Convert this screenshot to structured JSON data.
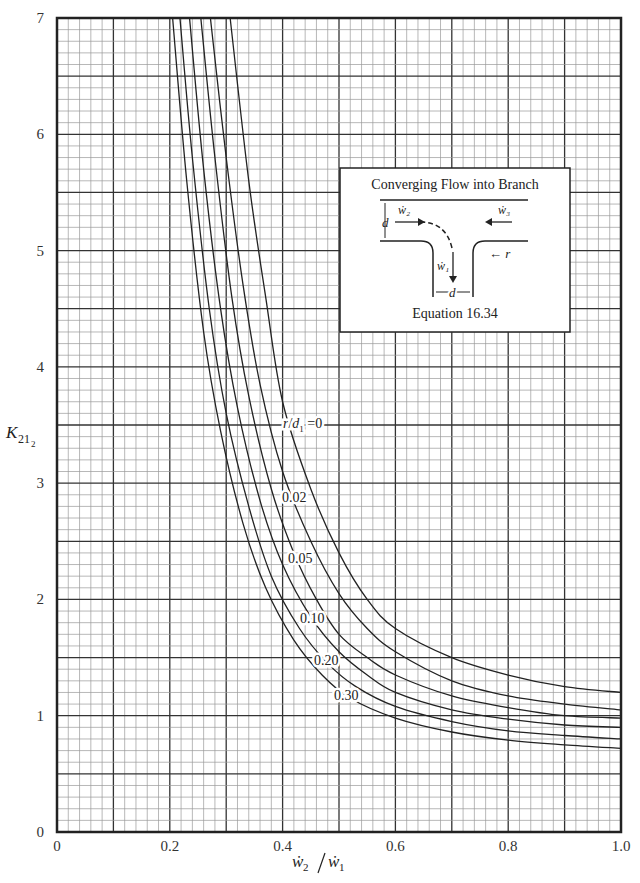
{
  "chart_data": {
    "type": "line",
    "title": "",
    "xlabel": "ẇ2/ẇ1",
    "ylabel": "K21_2",
    "xlim": [
      0,
      1.0
    ],
    "ylim": [
      0,
      7
    ],
    "grid": true,
    "x_ticks": [
      "0",
      "0.2",
      "0.4",
      "0.6",
      "0.8",
      "1.0"
    ],
    "y_ticks": [
      "0",
      "1",
      "2",
      "3",
      "4",
      "5",
      "6",
      "7"
    ],
    "legend_position": "inline labels",
    "series": [
      {
        "name": "r/d1=0",
        "label": "r/d1=0",
        "x": [
          0.307,
          0.34,
          0.37,
          0.4,
          0.45,
          0.5,
          0.55,
          0.6,
          0.7,
          0.8,
          0.9,
          1.0
        ],
        "y": [
          7.0,
          5.6,
          4.6,
          3.7,
          2.95,
          2.4,
          2.0,
          1.75,
          1.5,
          1.35,
          1.25,
          1.2
        ]
      },
      {
        "name": "r/d1=0.02",
        "label": "0.02",
        "x": [
          0.272,
          0.3,
          0.33,
          0.36,
          0.4,
          0.45,
          0.5,
          0.55,
          0.6,
          0.7,
          0.8,
          0.9,
          1.0
        ],
        "y": [
          7.0,
          5.8,
          4.7,
          3.85,
          3.1,
          2.5,
          2.05,
          1.75,
          1.55,
          1.3,
          1.17,
          1.1,
          1.05
        ]
      },
      {
        "name": "r/d1=0.05",
        "label": "0.05",
        "x": [
          0.255,
          0.28,
          0.31,
          0.34,
          0.38,
          0.42,
          0.46,
          0.5,
          0.55,
          0.6,
          0.7,
          0.8,
          0.9,
          1.0
        ],
        "y": [
          7.0,
          5.8,
          4.6,
          3.75,
          2.95,
          2.4,
          2.0,
          1.7,
          1.5,
          1.35,
          1.17,
          1.07,
          1.0,
          0.98
        ]
      },
      {
        "name": "r/d1=0.10",
        "label": "0.10",
        "x": [
          0.235,
          0.26,
          0.29,
          0.32,
          0.36,
          0.4,
          0.45,
          0.5,
          0.55,
          0.6,
          0.7,
          0.8,
          0.9,
          1.0
        ],
        "y": [
          7.0,
          5.7,
          4.5,
          3.65,
          2.85,
          2.3,
          1.85,
          1.55,
          1.35,
          1.2,
          1.05,
          0.97,
          0.92,
          0.9
        ]
      },
      {
        "name": "r/d1=0.20",
        "label": "0.20",
        "x": [
          0.218,
          0.24,
          0.27,
          0.3,
          0.34,
          0.38,
          0.43,
          0.48,
          0.53,
          0.6,
          0.7,
          0.8,
          0.9,
          1.0
        ],
        "y": [
          7.0,
          5.8,
          4.5,
          3.6,
          2.8,
          2.2,
          1.75,
          1.45,
          1.25,
          1.08,
          0.95,
          0.87,
          0.83,
          0.8
        ]
      },
      {
        "name": "r/d1=0.30",
        "label": "0.30",
        "x": [
          0.205,
          0.23,
          0.26,
          0.29,
          0.33,
          0.37,
          0.42,
          0.47,
          0.52,
          0.6,
          0.7,
          0.8,
          0.9,
          1.0
        ],
        "y": [
          7.0,
          5.6,
          4.3,
          3.45,
          2.65,
          2.1,
          1.65,
          1.35,
          1.15,
          0.98,
          0.86,
          0.79,
          0.75,
          0.72
        ]
      }
    ],
    "inset": {
      "title": "Converging Flow into Branch",
      "caption": "Equation 16.34",
      "labels": [
        "ẇ2",
        "ẇ3",
        "ẇ1",
        "d",
        "d",
        "r"
      ]
    }
  }
}
